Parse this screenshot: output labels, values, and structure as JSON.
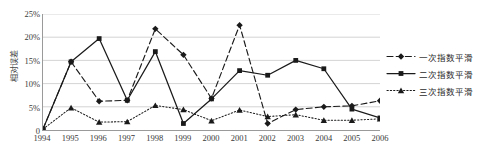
{
  "chart_data": {
    "type": "line",
    "title": "",
    "xlabel": "",
    "ylabel": "相对误差",
    "categories": [
      "1994",
      "1995",
      "1996",
      "1997",
      "1998",
      "1999",
      "2000",
      "2001",
      "2002",
      "2003",
      "2004",
      "2005",
      "2006"
    ],
    "ylim": [
      0,
      25
    ],
    "ytick_labels": [
      "0",
      "5%",
      "10%",
      "15%",
      "20%",
      "25%"
    ],
    "ytick_values": [
      0,
      5,
      10,
      15,
      20,
      25
    ],
    "grid": "horizontal",
    "legend_position": "right",
    "series": [
      {
        "name": "一次指数平滑",
        "style": "dashed",
        "marker": "diamond",
        "values": [
          0.2,
          14.7,
          6.2,
          6.4,
          21.8,
          16.2,
          6.8,
          22.6,
          1.4,
          4.4,
          5.0,
          5.2,
          6.3
        ]
      },
      {
        "name": "二次指数平滑",
        "style": "solid",
        "marker": "square",
        "values": [
          0.2,
          14.7,
          19.7,
          6.4,
          16.9,
          1.4,
          6.7,
          12.8,
          11.8,
          15.0,
          13.2,
          4.5,
          2.6
        ]
      },
      {
        "name": "三次指数平滑",
        "style": "dotted",
        "marker": "triangle",
        "values": [
          0.2,
          4.8,
          1.7,
          1.8,
          5.3,
          4.4,
          2.0,
          4.3,
          2.9,
          3.3,
          2.1,
          2.1,
          2.4
        ]
      }
    ]
  },
  "legend": {
    "items": [
      {
        "label": "一次指数平滑"
      },
      {
        "label": "二次指数平滑"
      },
      {
        "label": "三次指数平滑"
      }
    ]
  },
  "axis": {
    "y_title": "相对误差"
  }
}
